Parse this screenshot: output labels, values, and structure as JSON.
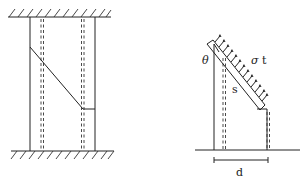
{
  "left_figure": {
    "description": "Wall panel between fixed top and bottom supports with diagonal tension field line and dashed stiffeners"
  },
  "right_figure": {
    "labels": {
      "theta": "θ",
      "sigma": "σ",
      "t": "t",
      "s": "s",
      "d": "d"
    }
  },
  "colors": {
    "line": "#222222",
    "background": "#ffffff"
  }
}
